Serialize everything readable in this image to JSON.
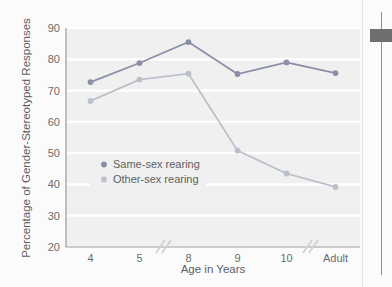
{
  "chart_data": {
    "type": "line",
    "title": "",
    "xlabel": "Age in Years",
    "ylabel": "Percentage of Gender-Stereotyped Responses",
    "categories": [
      "4",
      "5",
      "8",
      "9",
      "10",
      "Adult"
    ],
    "ylim": [
      20,
      90
    ],
    "yticks": [
      "20",
      "30",
      "40",
      "50",
      "60",
      "70",
      "80",
      "90"
    ],
    "grid": true,
    "legend_position": "inside-left",
    "axis_breaks": [
      "between 5 and 8",
      "between 10 and Adult"
    ],
    "series": [
      {
        "name": "Same-sex rearing",
        "color": "#8a8fa8",
        "values": [
          72.7,
          78.8,
          85.5,
          75.3,
          79.0,
          75.6
        ]
      },
      {
        "name": "Other-sex rearing",
        "color": "#b9c0c9",
        "values": [
          66.7,
          73.5,
          75.4,
          50.8,
          43.5,
          39.2
        ]
      }
    ]
  },
  "legend": {
    "items": [
      {
        "label": "Same-sex rearing",
        "marker_color": "#8a8fa8"
      },
      {
        "label": "Other-sex rearing",
        "marker_color": "#b9c0c9"
      }
    ]
  },
  "colors": {
    "plot_background": "#f0f0f0",
    "gridline": "#ffffff",
    "axis": "#9a9a9a",
    "tick_text": "#6b6b6b",
    "series_dark": "#8a8fa8",
    "series_light": "#b9c0c9",
    "scrollbar_thumb": "#6f6f6f"
  },
  "scrollbar": {
    "name": "vertical-scrollbar"
  }
}
